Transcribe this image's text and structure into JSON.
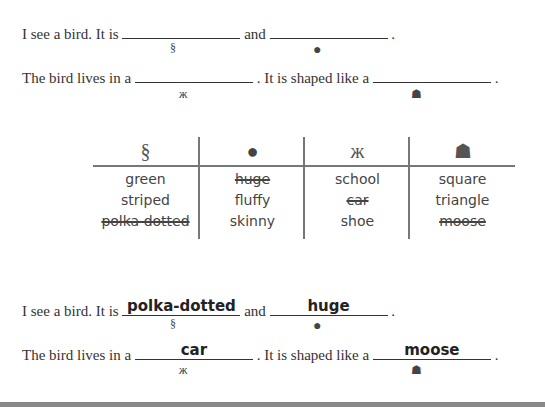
{
  "prompt": {
    "s1_a": "I see a bird. It is",
    "s1_b": "and",
    "s1_end": ".",
    "s2_a": "The bird lives in a",
    "s2_b": ". It is shaped like a",
    "s2_end": "."
  },
  "icons": {
    "seahorse": "🐉",
    "tomato": "●",
    "butterfly": "ж",
    "hedgehog": "☗"
  },
  "table": {
    "columns": [
      {
        "icon": "seahorse",
        "words": [
          {
            "text": "green",
            "crossed": false
          },
          {
            "text": "striped",
            "crossed": false
          },
          {
            "text": "polka dotted",
            "crossed": true
          }
        ]
      },
      {
        "icon": "tomato",
        "words": [
          {
            "text": "huge",
            "crossed": true
          },
          {
            "text": "fluffy",
            "crossed": false
          },
          {
            "text": "skinny",
            "crossed": false
          }
        ]
      },
      {
        "icon": "butterfly",
        "words": [
          {
            "text": "school",
            "crossed": false
          },
          {
            "text": "car",
            "crossed": true
          },
          {
            "text": "shoe",
            "crossed": false
          }
        ]
      },
      {
        "icon": "hedgehog",
        "words": [
          {
            "text": "square",
            "crossed": false
          },
          {
            "text": "triangle",
            "crossed": false
          },
          {
            "text": "moose",
            "crossed": true
          }
        ]
      }
    ]
  },
  "answers": {
    "blank1": "polka-dotted",
    "blank2": "huge",
    "blank3": "car",
    "blank4": "moose"
  }
}
